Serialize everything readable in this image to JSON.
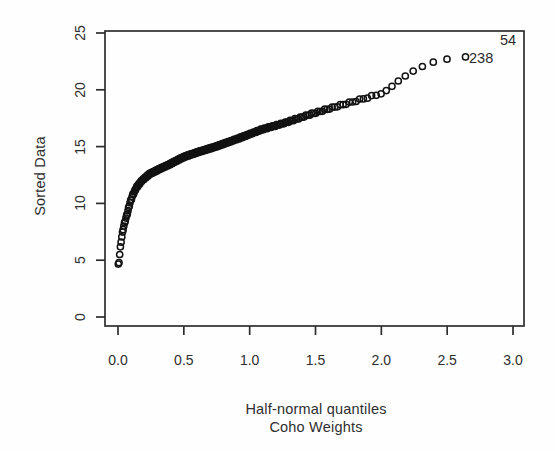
{
  "chart_data": {
    "type": "scatter",
    "title": "",
    "xlabel": "Half-normal quantiles",
    "xlabel2": "Coho Weights",
    "ylabel": "Sorted Data",
    "xlim": [
      0,
      3
    ],
    "ylim": [
      0,
      25
    ],
    "grid": false,
    "legend": "none",
    "x_ticks": [
      "0.0",
      "0.5",
      "1.0",
      "1.5",
      "2.0",
      "2.5",
      "3.0"
    ],
    "x_tick_values": [
      0,
      0.5,
      1,
      1.5,
      2,
      2.5,
      3
    ],
    "y_ticks": [
      "0",
      "5",
      "10",
      "15",
      "20",
      "25"
    ],
    "y_tick_values": [
      0,
      5,
      10,
      15,
      20,
      25
    ],
    "n_points": 240,
    "point_style": "open-circle",
    "x_rule": "half-normal quantiles x_i = qnorm((n+i)/(2n+1)), i=1..n, n=240",
    "curve_points": [
      [
        0.003,
        4.6
      ],
      [
        0.008,
        4.85
      ],
      [
        0.013,
        5.5
      ],
      [
        0.018,
        6.1
      ],
      [
        0.024,
        6.7
      ],
      [
        0.032,
        7.3
      ],
      [
        0.04,
        7.8
      ],
      [
        0.055,
        8.5
      ],
      [
        0.07,
        9.1
      ],
      [
        0.09,
        10.0
      ],
      [
        0.11,
        10.7
      ],
      [
        0.14,
        11.4
      ],
      [
        0.18,
        12.0
      ],
      [
        0.24,
        12.6
      ],
      [
        0.31,
        13.0
      ],
      [
        0.4,
        13.5
      ],
      [
        0.5,
        14.1
      ],
      [
        0.6,
        14.5
      ],
      [
        0.74,
        15.0
      ],
      [
        0.91,
        15.7
      ],
      [
        1.09,
        16.5
      ],
      [
        1.27,
        17.1
      ],
      [
        1.45,
        17.8
      ],
      [
        1.62,
        18.4
      ],
      [
        1.8,
        19.0
      ],
      [
        1.98,
        19.6
      ],
      [
        2.05,
        20.0
      ],
      [
        2.12,
        20.7
      ],
      [
        2.18,
        21.2
      ],
      [
        2.25,
        21.7
      ],
      [
        2.32,
        22.1
      ],
      [
        2.4,
        22.45
      ],
      [
        2.5,
        22.7
      ],
      [
        2.64,
        22.9
      ]
    ],
    "labeled_points": [
      {
        "label": "54",
        "x": 2.87,
        "y": 24.3,
        "note": "label only, marker not visible"
      },
      {
        "label": "238",
        "x": 2.64,
        "y": 22.9
      }
    ],
    "marker_color": "#121212",
    "axis_color": "#2e2e2e",
    "background_color": "#fefefe"
  }
}
